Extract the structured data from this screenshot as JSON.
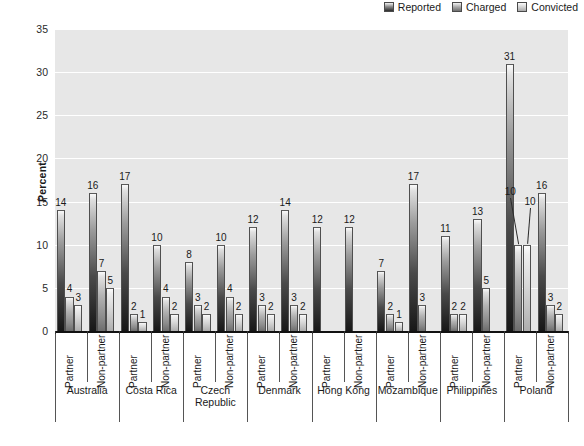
{
  "legend": {
    "items": [
      {
        "label": "Reported",
        "key": "reported",
        "icon": "legend-swatch-icon"
      },
      {
        "label": "Charged",
        "key": "charged",
        "icon": "legend-swatch-icon"
      },
      {
        "label": "Convicted",
        "key": "convicted",
        "icon": "legend-swatch-icon"
      }
    ]
  },
  "axis": {
    "ylabel": "Percent",
    "yticks": [
      "0",
      "5",
      "10",
      "15",
      "20",
      "25",
      "30",
      "35"
    ],
    "sublabels": [
      "Partner",
      "Non-partner"
    ]
  },
  "colors": {
    "plot_background": "#e7e7e7",
    "gridline": "#ffffff",
    "axis": "#111111",
    "reported": "#2b2b2b",
    "charged": "#8a8a8a",
    "convicted": "#cfcfcf"
  },
  "chart_data": {
    "type": "bar",
    "title": "",
    "xlabel": "",
    "ylabel": "Percent",
    "ylim": [
      0,
      35
    ],
    "ytick_step": 5,
    "grid": true,
    "legend_position": "top-right",
    "categories": [
      "Australia / Partner",
      "Australia / Non-partner",
      "Costa Rica / Partner",
      "Costa Rica / Non-partner",
      "Czech Republic / Partner",
      "Czech Republic / Non-partner",
      "Denmark / Partner",
      "Denmark / Non-partner",
      "Hong Kong / Partner",
      "Hong Kong / Non-partner",
      "Mozambique / Partner",
      "Mozambique / Non-partner",
      "Philippines / Partner",
      "Philippines / Non-partner",
      "Poland / Partner",
      "Poland / Non-partner"
    ],
    "series": [
      {
        "name": "Reported",
        "values": [
          14,
          16,
          17,
          10,
          8,
          10,
          12,
          14,
          12,
          12,
          7,
          17,
          11,
          13,
          31,
          16
        ]
      },
      {
        "name": "Charged",
        "values": [
          4,
          7,
          2,
          4,
          3,
          4,
          3,
          3,
          null,
          null,
          2,
          3,
          2,
          5,
          10,
          3
        ]
      },
      {
        "name": "Convicted",
        "values": [
          3,
          5,
          1,
          2,
          2,
          2,
          2,
          2,
          null,
          null,
          1,
          null,
          2,
          null,
          10,
          2
        ]
      }
    ],
    "groups": [
      {
        "country": "Australia",
        "subgroups": [
          {
            "sub": "Partner",
            "reported": 14,
            "charged": 4,
            "convicted": 3
          },
          {
            "sub": "Non-partner",
            "reported": 16,
            "charged": 7,
            "convicted": 5
          }
        ]
      },
      {
        "country": "Costa Rica",
        "subgroups": [
          {
            "sub": "Partner",
            "reported": 17,
            "charged": 2,
            "convicted": 1
          },
          {
            "sub": "Non-partner",
            "reported": 10,
            "charged": 4,
            "convicted": 2
          }
        ]
      },
      {
        "country": "Czech Republic",
        "subgroups": [
          {
            "sub": "Partner",
            "reported": 8,
            "charged": 3,
            "convicted": 2
          },
          {
            "sub": "Non-partner",
            "reported": 10,
            "charged": 4,
            "convicted": 2
          }
        ]
      },
      {
        "country": "Denmark",
        "subgroups": [
          {
            "sub": "Partner",
            "reported": 12,
            "charged": 3,
            "convicted": 2
          },
          {
            "sub": "Non-partner",
            "reported": 14,
            "charged": 3,
            "convicted": 2
          }
        ]
      },
      {
        "country": "Hong Kong",
        "subgroups": [
          {
            "sub": "Partner",
            "reported": 12,
            "charged": null,
            "convicted": null
          },
          {
            "sub": "Non-partner",
            "reported": 12,
            "charged": null,
            "convicted": null
          }
        ]
      },
      {
        "country": "Mozambique",
        "subgroups": [
          {
            "sub": "Partner",
            "reported": 7,
            "charged": 2,
            "convicted": 1
          },
          {
            "sub": "Non-partner",
            "reported": 17,
            "charged": 3,
            "convicted": null
          }
        ]
      },
      {
        "country": "Philippines",
        "subgroups": [
          {
            "sub": "Partner",
            "reported": 11,
            "charged": 2,
            "convicted": 2
          },
          {
            "sub": "Non-partner",
            "reported": 13,
            "charged": 5,
            "convicted": null
          }
        ]
      },
      {
        "country": "Poland",
        "subgroups": [
          {
            "sub": "Partner",
            "reported": 31,
            "charged": 10,
            "convicted": 10,
            "leader_lines": true
          },
          {
            "sub": "Non-partner",
            "reported": 16,
            "charged": 3,
            "convicted": 2
          }
        ]
      }
    ]
  }
}
